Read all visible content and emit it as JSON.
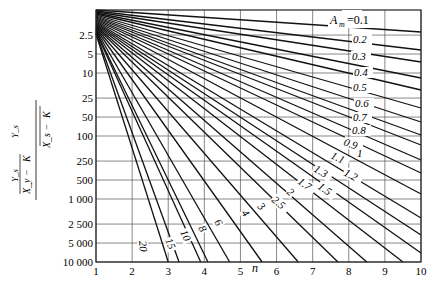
{
  "chart_data": {
    "type": "line",
    "title": "",
    "xlabel": "n",
    "ylabel": "(X_y − Y_s/K) / (X_s − Y_s/K)",
    "ylabel_parts": {
      "top_left": "Y_s",
      "bottom_left": "X_y − ",
      "frac_den": "K",
      "top_right": "Y_s",
      "bottom_right": "X_s − "
    },
    "xlim": [
      1,
      10
    ],
    "ylim": [
      1,
      10000
    ],
    "yscale": "log",
    "grid": true,
    "x_ticks": [
      "1",
      "2",
      "3",
      "4",
      "5",
      "6",
      "7",
      "8",
      "9",
      "10"
    ],
    "y_ticks": [
      {
        "label": "2.5",
        "value": 2.5
      },
      {
        "label": "5",
        "value": 5
      },
      {
        "label": "10",
        "value": 10
      },
      {
        "label": "25",
        "value": 25
      },
      {
        "label": "50",
        "value": 50
      },
      {
        "label": "100",
        "value": 100
      },
      {
        "label": "250",
        "value": 250
      },
      {
        "label": "500",
        "value": 500
      },
      {
        "label": "1 000",
        "value": 1000
      },
      {
        "label": "2 500",
        "value": 2500
      },
      {
        "label": "5 000",
        "value": 5000
      },
      {
        "label": "10 000",
        "value": 10000
      }
    ],
    "legend_prefix": "A_m =",
    "series": [
      {
        "name": "0.1",
        "x": [
          1,
          10
        ],
        "y_px": [
          10,
          32
        ]
      },
      {
        "name": "0.2",
        "x": [
          1,
          10
        ],
        "y_px": [
          11,
          50
        ]
      },
      {
        "name": "0.3",
        "x": [
          1,
          10
        ],
        "y_px": [
          12,
          62
        ]
      },
      {
        "name": "0.4",
        "x": [
          1,
          10
        ],
        "y_px": [
          13,
          78
        ]
      },
      {
        "name": "0.5",
        "x": [
          1,
          10
        ],
        "y_px": [
          14,
          90
        ]
      },
      {
        "name": "0.6",
        "x": [
          1,
          10
        ],
        "y_px": [
          15,
          108
        ]
      },
      {
        "name": "0.7",
        "x": [
          1,
          10
        ],
        "y_px": [
          16,
          122
        ]
      },
      {
        "name": "0.8",
        "x": [
          1,
          10
        ],
        "y_px": [
          17,
          135
        ]
      },
      {
        "name": "0.9",
        "x": [
          1,
          10
        ],
        "y_px": [
          18,
          145
        ]
      },
      {
        "name": "1",
        "x": [
          1,
          10
        ],
        "y_px": [
          19,
          160
        ]
      },
      {
        "name": "1.1",
        "x": [
          1,
          10
        ],
        "y_px": [
          20,
          173
        ]
      },
      {
        "name": "1.2",
        "x": [
          1,
          10
        ],
        "y_px": [
          21,
          194
        ]
      },
      {
        "name": "1.3",
        "x": [
          1,
          10
        ],
        "y_px": [
          22,
          218
        ]
      },
      {
        "name": "1.5",
        "x": [
          1,
          10
        ],
        "y_px": [
          23,
          235
        ]
      },
      {
        "name": "1.7",
        "x": [
          1,
          10
        ],
        "y_px": [
          24,
          253
        ]
      },
      {
        "name": "2",
        "x": [
          1,
          9.5
        ],
        "y_px": [
          25,
          262
        ]
      },
      {
        "name": "2.5",
        "x": [
          1,
          8.5
        ],
        "y_px": [
          26,
          262
        ]
      },
      {
        "name": "3",
        "x": [
          1,
          7.7
        ],
        "y_px": [
          27,
          262
        ]
      },
      {
        "name": "4",
        "x": [
          1,
          6.6
        ],
        "y_px": [
          28,
          262
        ]
      },
      {
        "name": "6",
        "x": [
          1,
          5.6
        ],
        "y_px": [
          29,
          262
        ]
      },
      {
        "name": "8",
        "x": [
          1,
          4.7
        ],
        "y_px": [
          30,
          262
        ]
      },
      {
        "name": "10",
        "x": [
          1,
          4.1
        ],
        "y_px": [
          31,
          262
        ]
      },
      {
        "name": "15",
        "x": [
          1,
          3.9
        ],
        "y_px": [
          32,
          262
        ]
      },
      {
        "name": "20",
        "x": [
          1,
          3.3
        ],
        "y_px": [
          33,
          262
        ]
      },
      {
        "name": "",
        "x": [
          1,
          3.0
        ],
        "y_px": [
          34,
          262
        ]
      }
    ],
    "curve_labels": [
      {
        "text": "0.1",
        "x": 343,
        "y": 19,
        "rot": 0
      },
      {
        "text": "0.2",
        "x": 353,
        "y": 43,
        "rot": 0
      },
      {
        "text": "0.3",
        "x": 352,
        "y": 60,
        "rot": 0
      },
      {
        "text": "0.4",
        "x": 354,
        "y": 76,
        "rot": 0
      },
      {
        "text": "0.5",
        "x": 353,
        "y": 91,
        "rot": 0
      },
      {
        "text": "0.6",
        "x": 355,
        "y": 107,
        "rot": 0
      },
      {
        "text": "0.7",
        "x": 353,
        "y": 121,
        "rot": 0
      },
      {
        "text": "0.8",
        "x": 352,
        "y": 134,
        "rot": 0
      },
      {
        "text": "0.9",
        "x": 343,
        "y": 145,
        "rot": 20
      },
      {
        "text": "1",
        "x": 357,
        "y": 157,
        "rot": 0
      },
      {
        "text": "1.1",
        "x": 330,
        "y": 158,
        "rot": 25
      },
      {
        "text": "1.2",
        "x": 343,
        "y": 175,
        "rot": 28
      },
      {
        "text": "1.3",
        "x": 313,
        "y": 171,
        "rot": 30
      },
      {
        "text": "1.5",
        "x": 317,
        "y": 188,
        "rot": 35
      },
      {
        "text": "1.7",
        "x": 297,
        "y": 183,
        "rot": 35
      },
      {
        "text": "2",
        "x": 286,
        "y": 193,
        "rot": 40
      },
      {
        "text": "2.5",
        "x": 271,
        "y": 201,
        "rot": 40
      },
      {
        "text": "3",
        "x": 257,
        "y": 207,
        "rot": 45
      },
      {
        "text": "4",
        "x": 241,
        "y": 213,
        "rot": 55
      },
      {
        "text": "6",
        "x": 214,
        "y": 222,
        "rot": 60
      },
      {
        "text": "8",
        "x": 198,
        "y": 228,
        "rot": 62
      },
      {
        "text": "10",
        "x": 180,
        "y": 232,
        "rot": 65
      },
      {
        "text": "15",
        "x": 165,
        "y": 240,
        "rot": 68
      },
      {
        "text": "20",
        "x": 139,
        "y": 241,
        "rot": 85
      }
    ]
  },
  "axes": {
    "x_title": "n",
    "legend_label": "A",
    "legend_sub": "m",
    "legend_eq": "=0.1"
  }
}
